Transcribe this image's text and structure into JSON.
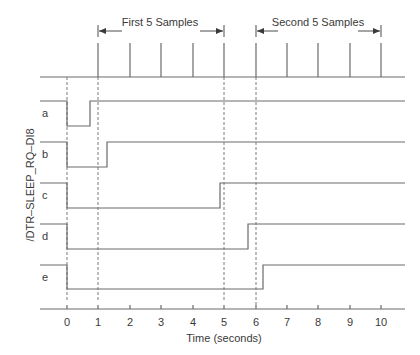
{
  "diagram": {
    "group1_label": "First 5 Samples",
    "group2_label": "Second 5 Samples",
    "ylabel": "/DTR–SLEEP_RQ–DI8",
    "xlabel": "Time (seconds)",
    "signals": [
      {
        "name": "a",
        "fall_t": 0,
        "rise_t": 0.75
      },
      {
        "name": "b",
        "fall_t": 0,
        "rise_t": 1.3
      },
      {
        "name": "c",
        "fall_t": 0,
        "rise_t": 4.9
      },
      {
        "name": "d",
        "fall_t": 0,
        "rise_t": 5.8
      },
      {
        "name": "e",
        "fall_t": 0,
        "rise_t": 6.25
      }
    ],
    "x_ticks": [
      "0",
      "1",
      "2",
      "3",
      "4",
      "5",
      "6",
      "7",
      "8",
      "9",
      "10"
    ],
    "sample_times": [
      1,
      2,
      3,
      4,
      5,
      6,
      7,
      8,
      9,
      10
    ],
    "dashed_markers": [
      0,
      1,
      5,
      6
    ],
    "colors": {
      "line": "#6a6a6a",
      "text": "#3a3a3a",
      "background": "#ffffff"
    }
  }
}
